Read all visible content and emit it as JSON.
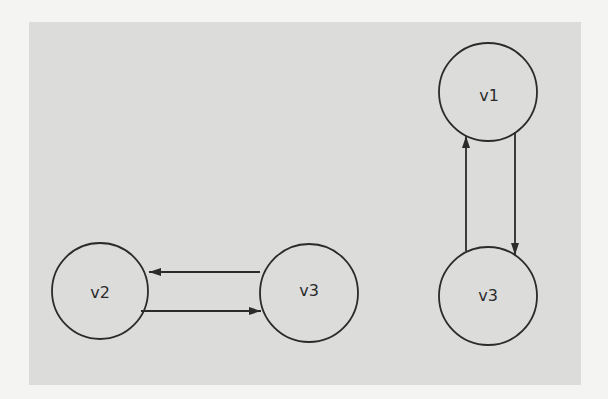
{
  "diagram": {
    "background_color": "#dcdcdb",
    "stroke_color": "#2b2b2b",
    "graphs": [
      {
        "name": "left-graph",
        "nodes": [
          {
            "id": "v2",
            "label": "v2",
            "cx": 100,
            "cy": 291,
            "r": 48
          },
          {
            "id": "v3",
            "label": "v3",
            "cx": 309,
            "cy": 293,
            "r": 49
          }
        ],
        "edges": [
          {
            "from": "v3",
            "to": "v2",
            "x1": 260,
            "y1": 272,
            "x2": 149,
            "y2": 272
          },
          {
            "from": "v2",
            "to": "v3",
            "x1": 141,
            "y1": 311,
            "x2": 261,
            "y2": 311
          }
        ]
      },
      {
        "name": "right-graph",
        "nodes": [
          {
            "id": "v1",
            "label": "v1",
            "cx": 488,
            "cy": 92,
            "r": 49
          },
          {
            "id": "v3",
            "label": "v3",
            "cx": 488,
            "cy": 296,
            "r": 49
          }
        ],
        "edges": [
          {
            "from": "v3",
            "to": "v1",
            "x1": 466,
            "y1": 251,
            "x2": 466,
            "y2": 136
          },
          {
            "from": "v1",
            "to": "v3",
            "x1": 515,
            "y1": 132,
            "x2": 515,
            "y2": 255
          }
        ]
      }
    ]
  }
}
